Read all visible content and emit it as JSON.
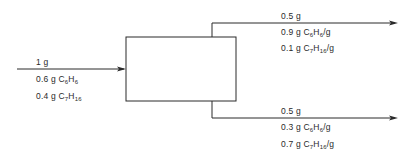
{
  "diagram": {
    "type": "process-flow",
    "unit": {
      "label": "separation-unit"
    },
    "streams": {
      "input": {
        "total": "1 g",
        "components": [
          {
            "amount": "0.6 g",
            "formula_base": "C",
            "c_sub": "6",
            "h": "H",
            "h_sub": "6",
            "suffix": ""
          },
          {
            "amount": "0.4 g",
            "formula_base": "C",
            "c_sub": "7",
            "h": "H",
            "h_sub": "16",
            "suffix": ""
          }
        ]
      },
      "top_output": {
        "total": "0.5 g",
        "components": [
          {
            "amount": "0.9 g",
            "formula_base": "C",
            "c_sub": "6",
            "h": "H",
            "h_sub": "6",
            "suffix": "/g"
          },
          {
            "amount": "0.1 g",
            "formula_base": "C",
            "c_sub": "7",
            "h": "H",
            "h_sub": "16",
            "suffix": "/g"
          }
        ]
      },
      "bottom_output": {
        "total": "0.5 g",
        "components": [
          {
            "amount": "0.3 g",
            "formula_base": "C",
            "c_sub": "6",
            "h": "H",
            "h_sub": "6",
            "suffix": "/g"
          },
          {
            "amount": "0.7 g",
            "formula_base": "C",
            "c_sub": "7",
            "h": "H",
            "h_sub": "16",
            "suffix": "/g"
          }
        ]
      }
    },
    "colors": {
      "line": "#2a2a2a",
      "background": "#ffffff"
    }
  }
}
